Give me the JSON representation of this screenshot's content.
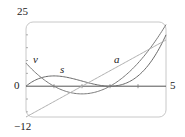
{
  "chart_data": {
    "type": "line",
    "title": "",
    "xlabel": "",
    "ylabel": "",
    "xlim": [
      0,
      5
    ],
    "ylim": [
      -12,
      25
    ],
    "x_tick_labels": [
      "0",
      "5"
    ],
    "y_tick_labels": [
      "25",
      "-12"
    ],
    "x_ticks": [
      1,
      2,
      3,
      4
    ],
    "y_ticks": [
      -10,
      -5,
      5,
      10,
      15,
      20
    ],
    "grid": false,
    "legend": "inline labels",
    "series": [
      {
        "name": "s",
        "expression": "t^3 - 6t^2 + 9t",
        "x": [
          0,
          0.5,
          1,
          1.5,
          2,
          2.5,
          3,
          3.5,
          4,
          4.5,
          5
        ],
        "values": [
          0,
          3.125,
          4,
          3.375,
          2,
          0.625,
          0,
          0.875,
          4,
          10.125,
          20
        ]
      },
      {
        "name": "v",
        "expression": "3t^2 - 12t + 9",
        "x": [
          0,
          0.5,
          1,
          1.5,
          2,
          2.5,
          3,
          3.5,
          4,
          4.5,
          5
        ],
        "values": [
          9,
          3.75,
          0,
          -2.25,
          -3,
          -2.25,
          0,
          3.75,
          9,
          15.75,
          24
        ]
      },
      {
        "name": "a",
        "expression": "6t - 12",
        "x": [
          0,
          5
        ],
        "values": [
          -12,
          18
        ]
      }
    ],
    "annotations": [
      {
        "text": "v",
        "x": 0.3,
        "y": 10.5
      },
      {
        "text": "s",
        "x": 1.3,
        "y": 6
      },
      {
        "text": "a",
        "x": 3.2,
        "y": 10
      }
    ]
  },
  "labels": {
    "y_max": "25",
    "y_min": "−12",
    "x_origin": "0",
    "x_max": "5",
    "curve_s": "s",
    "curve_v": "v",
    "curve_a": "a"
  }
}
